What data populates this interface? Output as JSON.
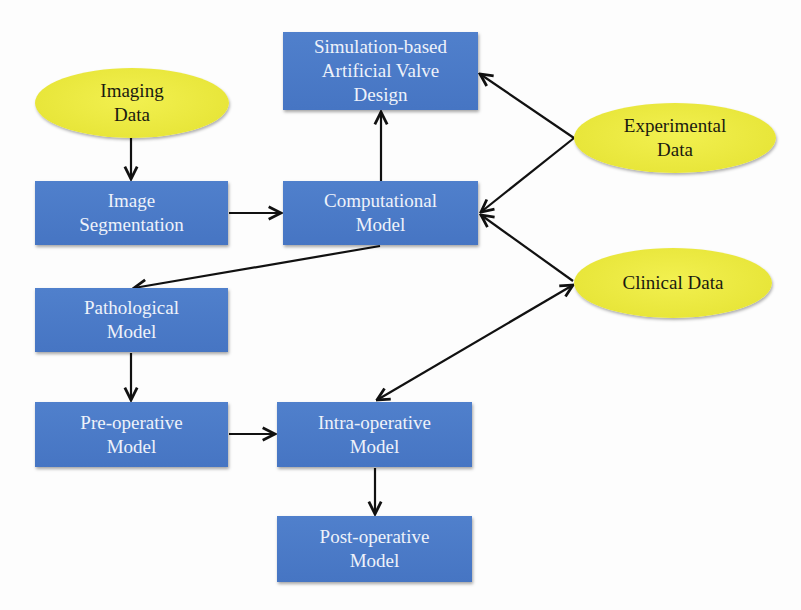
{
  "diagram": {
    "colors": {
      "box_fill": "#4a78c6",
      "box_text": "#eef2fa",
      "oval_fill": "#ece93e",
      "oval_text": "#1a1a10",
      "arrow": "#111111"
    },
    "data_sources": {
      "imaging": "Imaging\nData",
      "experimental": "Experimental\nData",
      "clinical": "Clinical Data"
    },
    "models": {
      "simulation": "Simulation-based\nArtificial Valve\nDesign",
      "image_segmentation": "Image\nSegmentation",
      "computational": "Computational\nModel",
      "pathological": "Pathological\nModel",
      "pre_operative": "Pre-operative\nModel",
      "intra_operative": "Intra-operative\nModel",
      "post_operative": "Post-operative\nModel"
    },
    "edges": [
      {
        "from": "Imaging Data",
        "to": "Image Segmentation"
      },
      {
        "from": "Image Segmentation",
        "to": "Computational Model"
      },
      {
        "from": "Computational Model",
        "to": "Simulation-based Artificial Valve Design"
      },
      {
        "from": "Experimental Data",
        "to": "Simulation-based Artificial Valve Design"
      },
      {
        "from": "Experimental Data",
        "to": "Computational Model"
      },
      {
        "from": "Clinical Data",
        "to": "Computational Model"
      },
      {
        "from": "Computational Model",
        "to": "Pathological Model"
      },
      {
        "from": "Pathological Model",
        "to": "Pre-operative Model"
      },
      {
        "from": "Pre-operative Model",
        "to": "Intra-operative Model"
      },
      {
        "from": "Clinical Data",
        "to": "Intra-operative Model",
        "bidirectional": true
      },
      {
        "from": "Intra-operative Model",
        "to": "Post-operative Model"
      }
    ]
  }
}
